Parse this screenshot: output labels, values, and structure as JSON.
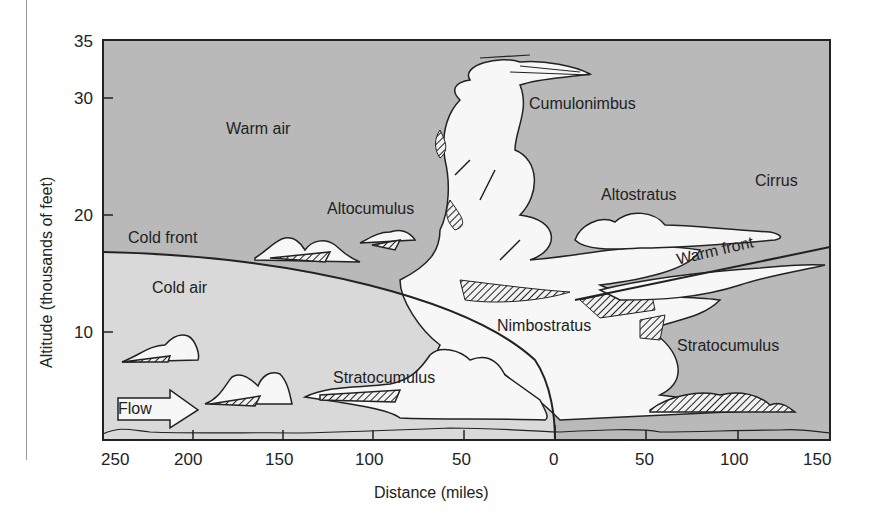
{
  "diagram": {
    "title": "",
    "axes": {
      "y_label": "Altitude (thousands of feet)",
      "x_label": "Distance (miles)",
      "y_ticks": [
        "35",
        "30",
        "20",
        "10"
      ],
      "x_ticks_left": [
        "250",
        "200",
        "150",
        "100",
        "50",
        "0"
      ],
      "x_ticks_right": [
        "50",
        "100",
        "150"
      ]
    },
    "labels": {
      "warm_air": "Warm air",
      "cold_air": "Cold air",
      "cold_front": "Cold front",
      "warm_front": "Warm front",
      "cumulonimbus": "Cumulonimbus",
      "altocumulus": "Altocumulus",
      "altostratus": "Altostratus",
      "cirrus": "Cirrus",
      "nimbostratus": "Nimbostratus",
      "stratocumulus_left": "Stratocumulus",
      "stratocumulus_right": "Stratocumulus",
      "flow": "Flow"
    },
    "colors": {
      "warm_air_fill": "#b9b9b9",
      "cold_air_fill": "#d9d9d9",
      "cloud_fill": "#f7f7f7",
      "outline": "#222222"
    }
  }
}
